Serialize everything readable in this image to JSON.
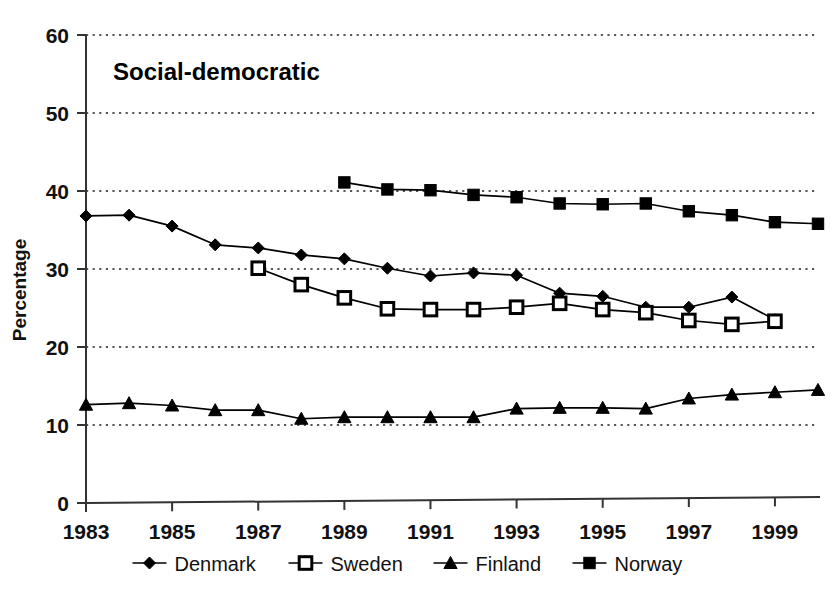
{
  "chart_data": {
    "type": "line",
    "title": "Social-democratic",
    "xlabel": "",
    "ylabel": "Percentage",
    "ylim": [
      0,
      60
    ],
    "xlim": [
      1983,
      2000
    ],
    "ytick_values": [
      0,
      10,
      20,
      30,
      40,
      50,
      60
    ],
    "ytick_labels": [
      "0",
      "10",
      "20",
      "30",
      "40",
      "50",
      "60"
    ],
    "xtick_values": [
      1983,
      1985,
      1987,
      1989,
      1991,
      1993,
      1995,
      1997,
      1999
    ],
    "xtick_labels": [
      "1983",
      "1985",
      "1987",
      "1989",
      "1991",
      "1993",
      "1995",
      "1997",
      "1999"
    ],
    "grid": "horizontal-dotted",
    "legend_position": "bottom",
    "series": [
      {
        "name": "Denmark",
        "marker": "filled-diamond",
        "color": "#000000",
        "x": [
          1983,
          1984,
          1985,
          1986,
          1987,
          1988,
          1989,
          1990,
          1991,
          1992,
          1993,
          1994,
          1995,
          1996,
          1997,
          1998,
          1999
        ],
        "values": [
          36.8,
          36.9,
          35.5,
          33.1,
          32.7,
          31.8,
          31.3,
          30.1,
          29.1,
          29.5,
          29.2,
          26.9,
          26.5,
          25.1,
          25.1,
          26.4,
          23.5
        ]
      },
      {
        "name": "Sweden",
        "marker": "open-square",
        "color": "#000000",
        "x": [
          1987,
          1988,
          1989,
          1990,
          1991,
          1992,
          1993,
          1994,
          1995,
          1996,
          1997,
          1998,
          1999
        ],
        "values": [
          30.1,
          28.0,
          26.3,
          24.9,
          24.8,
          24.8,
          25.1,
          25.6,
          24.8,
          24.4,
          23.4,
          22.9,
          23.3
        ]
      },
      {
        "name": "Finland",
        "marker": "filled-triangle",
        "color": "#000000",
        "x": [
          1983,
          1984,
          1985,
          1986,
          1987,
          1988,
          1989,
          1990,
          1991,
          1992,
          1993,
          1994,
          1995,
          1996,
          1997,
          1998,
          1999,
          2000
        ],
        "values": [
          12.6,
          12.8,
          12.5,
          11.9,
          11.9,
          10.8,
          11.0,
          11.0,
          11.0,
          11.0,
          12.1,
          12.2,
          12.2,
          12.1,
          13.4,
          13.9,
          14.2,
          14.5
        ]
      },
      {
        "name": "Norway",
        "marker": "filled-square",
        "color": "#000000",
        "x": [
          1989,
          1990,
          1991,
          1992,
          1993,
          1994,
          1995,
          1996,
          1997,
          1998,
          1999,
          2000
        ],
        "values": [
          41.1,
          40.2,
          40.1,
          39.5,
          39.2,
          38.4,
          38.3,
          38.4,
          37.4,
          36.9,
          36.0,
          35.8
        ]
      }
    ]
  },
  "axes": {
    "y_label": "Percentage"
  },
  "title": {
    "text": "Social-democratic"
  }
}
